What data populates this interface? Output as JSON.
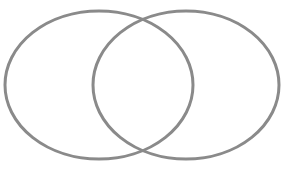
{
  "diagram": {
    "type": "venn",
    "width": 291,
    "height": 171,
    "background": "#ffffff",
    "stroke_color": "#8a8a8a",
    "stroke_width": 3,
    "sets": [
      {
        "id": "set-a",
        "label": "",
        "cx": 99,
        "cy": 85,
        "rx": 94,
        "ry": 74
      },
      {
        "id": "set-b",
        "label": "",
        "cx": 186,
        "cy": 85,
        "rx": 93,
        "ry": 74
      }
    ],
    "intersections": [
      {
        "x": 143,
        "y": 18
      },
      {
        "x": 143,
        "y": 151
      }
    ]
  }
}
